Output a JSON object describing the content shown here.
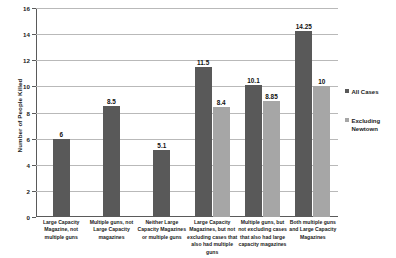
{
  "chart_data": {
    "type": "bar",
    "title": "",
    "xlabel": "",
    "ylabel": "Number of People Killed",
    "ylim": [
      0,
      16
    ],
    "yticks": [
      0,
      2,
      4,
      6,
      8,
      10,
      12,
      14,
      16
    ],
    "grid": true,
    "legend_position": "right",
    "categories": [
      "Large Capacity Magazine, not multiple guns",
      "Multiple guns, not Large Capacity magazines",
      "Neither Large Capacity Magazines or multiple guns",
      "Large Capacity Magazines, but not excluding cases that also had multiple guns",
      "Multiple guns, but not excluding cases that also had large capacity magazines",
      "Both multiple guns and Large Capacity Magazines"
    ],
    "series": [
      {
        "name": "All Cases",
        "color": "#595959",
        "values": [
          6,
          8.5,
          5.1,
          11.5,
          10.1,
          14.25
        ],
        "labels": [
          "6",
          "8.5",
          "5.1",
          "11.5",
          "10.1",
          "14.25"
        ]
      },
      {
        "name": "Excluding Newtown",
        "color": "#a6a6a6",
        "values": [
          null,
          null,
          null,
          8.4,
          8.85,
          10
        ],
        "labels": [
          "",
          "",
          "",
          "8.4",
          "8.85",
          "10"
        ]
      }
    ]
  }
}
